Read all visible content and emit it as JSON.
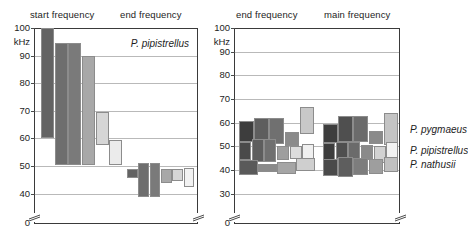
{
  "figure": {
    "unit": "kHz"
  },
  "panels": [
    {
      "id": "left",
      "headers": [
        "start frequency",
        "end frequency"
      ],
      "inset_label": "P. pipistrellus",
      "axis": {
        "unit_label": "kHz",
        "ticks": [
          "100",
          "90",
          "80",
          "70",
          "60",
          "50",
          "40"
        ],
        "zero_label": "0",
        "min": 35,
        "max": 100,
        "break_below": 40
      }
    },
    {
      "id": "right",
      "headers": [
        "end frequency",
        "main frequency"
      ],
      "row_labels": [
        "P. pygmaeus",
        "P. pipistrellus",
        "P. nathusii"
      ],
      "axis": {
        "unit_label": "kHz",
        "ticks": [
          "100",
          "90",
          "80",
          "70",
          "60",
          "50",
          "40",
          "30"
        ],
        "zero_label": "0",
        "min": 25,
        "max": 100,
        "break_below": 30
      }
    }
  ],
  "chart_data": {
    "type": "bar",
    "xlabel": "",
    "ylabel": "kHz",
    "grid": true,
    "legend": "none",
    "panels": [
      {
        "name": "P. pipistrellus",
        "ylim": [
          35,
          100
        ],
        "yticks": [
          40,
          50,
          60,
          70,
          80,
          90,
          100
        ],
        "groups": [
          {
            "label": "start frequency",
            "bars": [
              {
                "id": "s1",
                "low": 60.0,
                "high": 100.0,
                "color": "#636363"
              },
              {
                "id": "s2",
                "low": 50.5,
                "high": 94.5,
                "color": "#6e6e6e"
              },
              {
                "id": "s3",
                "low": 50.5,
                "high": 94.5,
                "color": "#7a7a7a"
              },
              {
                "id": "s4",
                "low": 50.5,
                "high": 90.0,
                "color": "#a8a8a8"
              },
              {
                "id": "s5",
                "low": 57.5,
                "high": 69.5,
                "color": "#d6d6d6"
              },
              {
                "id": "s6",
                "low": 50.5,
                "high": 59.5,
                "color": "#ebebeb"
              }
            ]
          },
          {
            "label": "end frequency",
            "bars": [
              {
                "id": "e1",
                "low": 45.5,
                "high": 49.0,
                "color": "#636363"
              },
              {
                "id": "e2",
                "low": 38.8,
                "high": 51.2,
                "color": "#6e6e6e"
              },
              {
                "id": "e3",
                "low": 38.8,
                "high": 51.2,
                "color": "#7a7a7a"
              },
              {
                "id": "e4",
                "low": 44.0,
                "high": 48.8,
                "color": "#a8a8a8"
              },
              {
                "id": "e5",
                "low": 44.5,
                "high": 48.8,
                "color": "#d6d6d6"
              },
              {
                "id": "e6",
                "low": 42.5,
                "high": 49.2,
                "color": "#f2f2f2"
              }
            ]
          }
        ]
      },
      {
        "name": "three species",
        "ylim": [
          25,
          100
        ],
        "yticks": [
          30,
          40,
          50,
          60,
          70,
          80,
          90,
          100
        ],
        "rows": [
          "P. pygmaeus",
          "P. pipistrellus",
          "P. nathusii"
        ],
        "groups": [
          {
            "label": "end frequency",
            "series": [
              {
                "row": "P. pygmaeus",
                "bars": [
                  {
                    "low": 52.0,
                    "high": 60.5,
                    "color": "#3d3d3d"
                  },
                  {
                    "low": 51.0,
                    "high": 62.0,
                    "color": "#5e5e5e"
                  },
                  {
                    "low": 51.0,
                    "high": 62.0,
                    "color": "#707070"
                  },
                  {
                    "low": 50.0,
                    "high": 56.0,
                    "color": "#8a8a8a"
                  },
                  {
                    "low": 55.0,
                    "high": 66.5,
                    "color": "#c8c8c8"
                  }
                ]
              },
              {
                "row": "P. pipistrellus",
                "bars": [
                  {
                    "low": 44.0,
                    "high": 52.0,
                    "color": "#4a4a4a"
                  },
                  {
                    "low": 43.5,
                    "high": 53.0,
                    "color": "#5e5e5e"
                  },
                  {
                    "low": 43.5,
                    "high": 53.0,
                    "color": "#707070"
                  },
                  {
                    "low": 44.0,
                    "high": 50.0,
                    "color": "#9e9e9e"
                  },
                  {
                    "low": 44.5,
                    "high": 50.0,
                    "color": "#dcdcdc"
                  },
                  {
                    "low": 43.0,
                    "high": 51.0,
                    "color": "#f0f0f0"
                  }
                ]
              },
              {
                "row": "P. nathusii",
                "bars": [
                  {
                    "low": 38.0,
                    "high": 44.0,
                    "color": "#5a5a5a"
                  },
                  {
                    "low": 39.0,
                    "high": 42.5,
                    "color": "#8a8a8a"
                  },
                  {
                    "low": 38.5,
                    "high": 43.5,
                    "color": "#a5a5a5"
                  },
                  {
                    "low": 39.5,
                    "high": 45.0,
                    "color": "#cfcfcf"
                  }
                ]
              }
            ]
          },
          {
            "label": "main frequency",
            "series": [
              {
                "row": "P. pygmaeus",
                "bars": [
                  {
                    "low": 51.5,
                    "high": 59.5,
                    "color": "#3d3d3d"
                  },
                  {
                    "low": 52.0,
                    "high": 63.0,
                    "color": "#4f4f4f"
                  },
                  {
                    "low": 52.0,
                    "high": 63.0,
                    "color": "#6b6b6b"
                  },
                  {
                    "low": 51.0,
                    "high": 56.5,
                    "color": "#8a8a8a"
                  },
                  {
                    "low": 50.5,
                    "high": 64.0,
                    "color": "#c4c4c4"
                  }
                ]
              },
              {
                "row": "P. pipistrellus",
                "bars": [
                  {
                    "low": 43.0,
                    "high": 51.5,
                    "color": "#3d3d3d"
                  },
                  {
                    "low": 44.5,
                    "high": 52.0,
                    "color": "#4f4f4f"
                  },
                  {
                    "low": 44.5,
                    "high": 52.0,
                    "color": "#6b6b6b"
                  },
                  {
                    "low": 44.0,
                    "high": 50.5,
                    "color": "#8a8a8a"
                  },
                  {
                    "low": 43.0,
                    "high": 50.0,
                    "color": "#d2d2d2"
                  },
                  {
                    "low": 44.0,
                    "high": 52.0,
                    "color": "#f2f2f2"
                  }
                ]
              },
              {
                "row": "P. nathusii",
                "bars": [
                  {
                    "low": 37.5,
                    "high": 44.5,
                    "color": "#4a4a4a"
                  },
                  {
                    "low": 37.0,
                    "high": 45.5,
                    "color": "#5e5e5e"
                  },
                  {
                    "low": 38.0,
                    "high": 45.0,
                    "color": "#7d7d7d"
                  },
                  {
                    "low": 38.5,
                    "high": 44.5,
                    "color": "#9e9e9e"
                  },
                  {
                    "low": 39.0,
                    "high": 45.5,
                    "color": "#c0c0c0"
                  }
                ]
              }
            ]
          }
        ]
      }
    ]
  }
}
